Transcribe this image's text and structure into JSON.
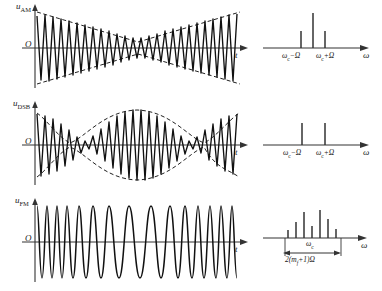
{
  "figure": {
    "colors": {
      "ink": "#1a1a1a",
      "background": "#ffffff",
      "carrier_curve": "#111111",
      "envelope_dashed": "#222222",
      "axis": "#333333"
    }
  },
  "rows": [
    {
      "id": "am",
      "time": {
        "y_axis_label": "u",
        "y_axis_sub": "AM",
        "origin_label": "O",
        "x_axis_label": "t",
        "envelope": "dashed bow-tie envelope, minimum at centre, maximum at both ends",
        "carrier_cycles": 17
      },
      "spectrum": {
        "x_axis_label": "ω",
        "lines": [
          {
            "label_main": "ω",
            "label_sub": "c",
            "label_suffix": "−Ω",
            "height": 0.45,
            "show_label": true
          },
          {
            "label_main": "ω",
            "label_sub": "c",
            "label_suffix": "",
            "height": 1.0,
            "show_label": false
          },
          {
            "label_main": "ω",
            "label_sub": "c",
            "label_suffix": "+Ω",
            "height": 0.45,
            "show_label": true
          }
        ],
        "tick_label_left": "ωc−Ω",
        "tick_label_right": "ωc+Ω"
      }
    },
    {
      "id": "dsb",
      "time": {
        "y_axis_label": "u",
        "y_axis_sub": "DSB",
        "origin_label": "O",
        "x_axis_label": "t",
        "envelope": "dashed full-wave rectified sinusoid envelope with phase reversals at the nulls",
        "carrier_cycles": 17
      },
      "spectrum": {
        "x_axis_label": "ω",
        "lines": [
          {
            "label_main": "ω",
            "label_sub": "c",
            "label_suffix": "−Ω",
            "height": 0.62,
            "show_label": true
          },
          {
            "label_main": "ω",
            "label_sub": "c",
            "label_suffix": "+Ω",
            "height": 0.62,
            "show_label": true
          }
        ],
        "tick_label_left": "ωc−Ω",
        "tick_label_right": "ωc+Ω"
      }
    },
    {
      "id": "fm",
      "time": {
        "y_axis_label": "u",
        "y_axis_sub": "FM",
        "origin_label": "O",
        "x_axis_label": "t",
        "envelope": "constant amplitude, instantaneous frequency varies",
        "carrier_cycles": 16
      },
      "spectrum": {
        "x_axis_label": "ω",
        "centre_label_main": "ω",
        "centre_label_sub": "c",
        "bandwidth_label": "2(m f +1)Ω",
        "bandwidth_parts": {
          "prefix": "2(",
          "m": "m",
          "sub": "f",
          "mid": "+1)",
          "suffix": "Ω"
        },
        "lines": [
          {
            "height": 0.28
          },
          {
            "height": 0.55
          },
          {
            "height": 0.92
          },
          {
            "height": 0.42
          },
          {
            "height": 1.0
          },
          {
            "height": 0.7
          },
          {
            "height": 0.3
          }
        ]
      }
    }
  ]
}
